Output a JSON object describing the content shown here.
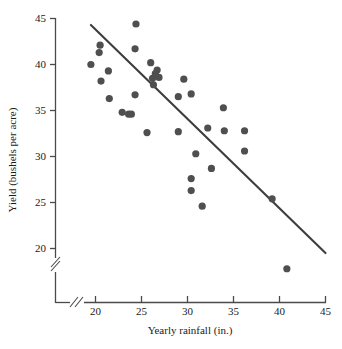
{
  "chart_data": {
    "type": "scatter",
    "title": "",
    "xlabel": "Yearly rainfall (in.)",
    "ylabel": "Yield (bushels per acre)",
    "xlim": [
      18.2,
      45.5
    ],
    "ylim": [
      17.0,
      45.3
    ],
    "xticks": [
      20,
      25,
      30,
      35,
      40,
      45
    ],
    "yticks": [
      20,
      25,
      30,
      35,
      40,
      45
    ],
    "xtick_labels": [
      "20",
      "25",
      "30",
      "35",
      "40",
      "45"
    ],
    "ytick_labels": [
      "20",
      "25",
      "30",
      "35",
      "40",
      "45"
    ],
    "grid": false,
    "legend": "none",
    "x_axis_break": true,
    "y_axis_break": true,
    "points": [
      {
        "x": 19.5,
        "y": 40.0
      },
      {
        "x": 20.5,
        "y": 42.1
      },
      {
        "x": 20.4,
        "y": 41.3
      },
      {
        "x": 20.6,
        "y": 38.2
      },
      {
        "x": 21.4,
        "y": 39.3
      },
      {
        "x": 21.5,
        "y": 36.3
      },
      {
        "x": 22.9,
        "y": 34.8
      },
      {
        "x": 23.6,
        "y": 34.6
      },
      {
        "x": 23.9,
        "y": 34.6
      },
      {
        "x": 24.3,
        "y": 41.7
      },
      {
        "x": 24.4,
        "y": 44.4
      },
      {
        "x": 24.3,
        "y": 36.7
      },
      {
        "x": 25.6,
        "y": 32.6
      },
      {
        "x": 26.0,
        "y": 40.2
      },
      {
        "x": 26.2,
        "y": 38.5
      },
      {
        "x": 26.5,
        "y": 39.0
      },
      {
        "x": 26.7,
        "y": 39.4
      },
      {
        "x": 26.9,
        "y": 38.6
      },
      {
        "x": 26.3,
        "y": 37.8
      },
      {
        "x": 29.0,
        "y": 36.5
      },
      {
        "x": 29.0,
        "y": 32.7
      },
      {
        "x": 29.6,
        "y": 38.4
      },
      {
        "x": 30.4,
        "y": 36.8
      },
      {
        "x": 30.4,
        "y": 27.6
      },
      {
        "x": 30.4,
        "y": 26.3
      },
      {
        "x": 30.9,
        "y": 30.3
      },
      {
        "x": 31.6,
        "y": 24.6
      },
      {
        "x": 32.2,
        "y": 33.1
      },
      {
        "x": 32.6,
        "y": 28.7
      },
      {
        "x": 33.9,
        "y": 35.3
      },
      {
        "x": 34.0,
        "y": 32.8
      },
      {
        "x": 36.2,
        "y": 32.8
      },
      {
        "x": 36.2,
        "y": 30.6
      },
      {
        "x": 39.2,
        "y": 25.4
      },
      {
        "x": 40.8,
        "y": 17.8
      }
    ],
    "fit_line": {
      "label": "regression line",
      "x1": 19.5,
      "y1": 44.3,
      "x2": 45.0,
      "y2": 19.5
    },
    "colors": {
      "point": "#4f4f4f",
      "line": "#3d3d3d",
      "axis": "#4a4a4a",
      "text": "#1a1a1a",
      "background": "#ffffff"
    }
  }
}
